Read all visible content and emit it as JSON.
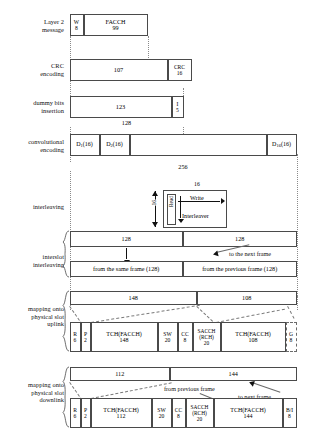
{
  "diagram": {
    "stage_labels": {
      "layer2": "Layer 2\nmessage",
      "crc": "CRC\nencoding",
      "dummy": "dummy bits\ninsertion",
      "conv": "convolutional\nencoding",
      "interleaving": "interleaving",
      "interslot": "interslot\ninterleaving",
      "uplink": "mapping onto\nphysical slot\nuplink",
      "downlink": "mapping onto\nphysical slot\ndownlink"
    },
    "layer2_row": {
      "w_label": "W",
      "w_value": "8",
      "facch_label": "FACCH",
      "facch_value": "99"
    },
    "crc_row": {
      "data_value": "107",
      "crc_label": "CRC",
      "crc_value": "16"
    },
    "dummy_row": {
      "data_value": "123",
      "i_label": "I",
      "i_value": "5",
      "dimension": "128"
    },
    "conv_row": {
      "d1": "D",
      "d1_sub": "1",
      "d1_size": "(16)",
      "d2": "D",
      "d2_sub": "2",
      "d2_size": "(16)",
      "d16": "D",
      "d16_sub": "16",
      "d16_size": "(16)",
      "dimension": "256"
    },
    "interleaver": {
      "width_dim": "16",
      "height_dim": "16",
      "write_label": "Write",
      "read_label": "Read",
      "name": "Interleaver"
    },
    "interslot_row": {
      "top_left": "128",
      "top_right": "128",
      "bottom_left": "from the same frame (128)",
      "bottom_right": "from the previous frame (128)",
      "annotation": "to the next frame"
    },
    "uplink": {
      "header_left": "148",
      "header_right": "108",
      "cells": [
        {
          "label": "R",
          "value": "6"
        },
        {
          "label": "P",
          "value": "2"
        },
        {
          "label": "TCH(FACCH)",
          "value": "148"
        },
        {
          "label": "SW",
          "value": "20"
        },
        {
          "label": "CC",
          "value": "8"
        },
        {
          "label": "SACCH",
          "label2": "(RCH)",
          "value": "20"
        },
        {
          "label": "TCH(FACCH)",
          "value": "108"
        },
        {
          "label": "G",
          "value": "8"
        }
      ]
    },
    "downlink": {
      "header_left": "112",
      "header_right": "144",
      "annotation_prev": "from previous frame",
      "annotation_next": "to next frame",
      "cells": [
        {
          "label": "R",
          "value": "6"
        },
        {
          "label": "P",
          "value": "2"
        },
        {
          "label": "TCH(FACCH)",
          "value": "112"
        },
        {
          "label": "SW",
          "value": "20"
        },
        {
          "label": "CC",
          "value": "8"
        },
        {
          "label": "SACCH",
          "label2": "(RCH)",
          "value": "20"
        },
        {
          "label": "TCH(FACCH)",
          "value": "144"
        },
        {
          "label": "B/I",
          "value": "8"
        }
      ]
    }
  }
}
